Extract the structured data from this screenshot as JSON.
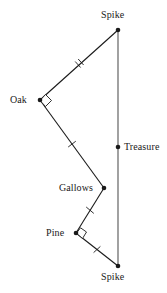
{
  "figure": {
    "colors": {
      "stroke": "#1a1a1a",
      "vertical_line": "#555555",
      "text": "#1a1a1a",
      "background": "#ffffff",
      "marker_fill": "#ffffff"
    },
    "vertices": [
      {
        "id": "spike-top",
        "label": "Spike",
        "x": 118,
        "y": 30,
        "dot": true
      },
      {
        "id": "oak",
        "label": "Oak",
        "x": 40,
        "y": 100,
        "dot": true
      },
      {
        "id": "treasure",
        "label": "Treasure",
        "x": 118,
        "y": 147,
        "dot": true
      },
      {
        "id": "gallows",
        "label": "Gallows",
        "x": 104,
        "y": 188,
        "dot": true
      },
      {
        "id": "pine",
        "label": "Pine",
        "x": 76,
        "y": 233,
        "dot": true
      },
      {
        "id": "spike-bottom",
        "label": "Spike",
        "x": 118,
        "y": 266,
        "dot": true
      }
    ],
    "segments": [
      {
        "id": "spike-top-to-oak",
        "from": "spike-top",
        "to": "oak",
        "ticks": 2
      },
      {
        "id": "oak-to-gallows",
        "from": "oak",
        "to": "gallows",
        "ticks": 1
      },
      {
        "id": "gallows-to-pine",
        "from": "gallows",
        "to": "pine",
        "ticks": 1
      },
      {
        "id": "pine-to-spike-bottom",
        "from": "pine",
        "to": "spike-bottom",
        "ticks": 1
      },
      {
        "id": "spike-to-spike-axis",
        "from": "spike-top",
        "to": "spike-bottom",
        "ticks": 0
      }
    ],
    "right_angles": [
      {
        "id": "right-angle-oak",
        "at": "oak",
        "x": 40,
        "y": 100
      },
      {
        "id": "right-angle-pine",
        "at": "pine",
        "x": 76,
        "y": 233
      }
    ]
  }
}
